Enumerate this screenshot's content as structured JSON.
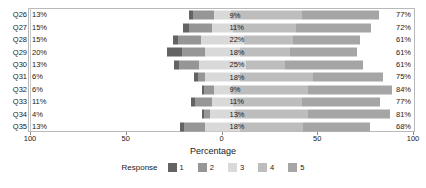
{
  "chart_data": {
    "type": "bar",
    "subtype": "diverging-stacked-likert",
    "title": "",
    "xlabel": "Percentage",
    "ylabel": "",
    "xlim": [
      -100,
      100
    ],
    "xticks": [
      100,
      50,
      0,
      50,
      100
    ],
    "grid": false,
    "legend": {
      "title": "Response",
      "position": "bottom",
      "entries": [
        {
          "label": "1",
          "color": "#636363"
        },
        {
          "label": "2",
          "color": "#969696"
        },
        {
          "label": "3",
          "color": "#d9d9d9"
        },
        {
          "label": "4",
          "color": "#bdbdbd"
        },
        {
          "label": "5",
          "color": "#a5a5a5"
        }
      ]
    },
    "categories": [
      "Q26",
      "Q27",
      "Q28",
      "Q29",
      "Q30",
      "Q31",
      "Q32",
      "Q33",
      "Q34",
      "Q35"
    ],
    "left_labels": [
      "13%",
      "15%",
      "15%",
      "20%",
      "13%",
      "6%",
      "6%",
      "11%",
      "4%",
      "13%"
    ],
    "mid_labels": [
      "9%",
      "11%",
      "22%",
      "18%",
      "25%",
      "18%",
      "9%",
      "11%",
      "13%",
      "18%"
    ],
    "right_labels": [
      "77%",
      "72%",
      "61%",
      "61%",
      "61%",
      "75%",
      "84%",
      "77%",
      "81%",
      "68%"
    ],
    "series": [
      {
        "name": "1",
        "color": "#636363",
        "values": [
          2,
          3,
          3,
          8,
          3,
          2,
          1,
          2,
          1,
          2
        ]
      },
      {
        "name": "2",
        "color": "#969696",
        "values": [
          11,
          12,
          12,
          12,
          10,
          4,
          5,
          9,
          3,
          11
        ]
      },
      {
        "name": "3",
        "color": "#d9d9d9",
        "values": [
          9,
          11,
          22,
          18,
          25,
          18,
          9,
          11,
          13,
          18
        ]
      },
      {
        "name": "4",
        "color": "#bdbdbd",
        "values": [
          37,
          33,
          26,
          26,
          20,
          38,
          40,
          36,
          38,
          33
        ]
      },
      {
        "name": "5",
        "color": "#a5a5a5",
        "values": [
          40,
          39,
          35,
          35,
          41,
          37,
          44,
          41,
          43,
          35
        ]
      }
    ],
    "rows": [
      {
        "category": "Q26",
        "left_label": "13%",
        "mid_label": "9%",
        "right_label": "77%",
        "segments": [
          {
            "series": "1",
            "value": 2,
            "start": -17.5
          },
          {
            "series": "2",
            "value": 11,
            "start": -15.5
          },
          {
            "series": "3",
            "value": 9,
            "start": -4.5
          },
          {
            "series": "4",
            "value": 37,
            "start": 4.5
          },
          {
            "series": "5",
            "value": 40,
            "start": 41.5
          }
        ]
      },
      {
        "category": "Q27",
        "left_label": "15%",
        "mid_label": "11%",
        "right_label": "72%",
        "segments": [
          {
            "series": "1",
            "value": 3,
            "start": -20.5
          },
          {
            "series": "2",
            "value": 12,
            "start": -17.5
          },
          {
            "series": "3",
            "value": 11,
            "start": -5.5
          },
          {
            "series": "4",
            "value": 33,
            "start": 5.5
          },
          {
            "series": "5",
            "value": 39,
            "start": 38.5
          }
        ]
      },
      {
        "category": "Q28",
        "left_label": "15%",
        "mid_label": "22%",
        "right_label": "61%",
        "segments": [
          {
            "series": "1",
            "value": 3,
            "start": -26
          },
          {
            "series": "2",
            "value": 12,
            "start": -23
          },
          {
            "series": "3",
            "value": 22,
            "start": -11
          },
          {
            "series": "4",
            "value": 26,
            "start": 11
          },
          {
            "series": "5",
            "value": 35,
            "start": 37
          }
        ]
      },
      {
        "category": "Q29",
        "left_label": "20%",
        "mid_label": "18%",
        "right_label": "61%",
        "segments": [
          {
            "series": "1",
            "value": 8,
            "start": -29
          },
          {
            "series": "2",
            "value": 12,
            "start": -21
          },
          {
            "series": "3",
            "value": 18,
            "start": -9
          },
          {
            "series": "4",
            "value": 26,
            "start": 9
          },
          {
            "series": "5",
            "value": 35,
            "start": 35
          }
        ]
      },
      {
        "category": "Q30",
        "left_label": "13%",
        "mid_label": "25%",
        "right_label": "61%",
        "segments": [
          {
            "series": "1",
            "value": 3,
            "start": -25.5
          },
          {
            "series": "2",
            "value": 10,
            "start": -22.5
          },
          {
            "series": "3",
            "value": 25,
            "start": -12.5
          },
          {
            "series": "4",
            "value": 20,
            "start": 12.5
          },
          {
            "series": "5",
            "value": 41,
            "start": 32.5
          }
        ]
      },
      {
        "category": "Q31",
        "left_label": "6%",
        "mid_label": "18%",
        "right_label": "75%",
        "segments": [
          {
            "series": "1",
            "value": 2,
            "start": -15
          },
          {
            "series": "2",
            "value": 4,
            "start": -13
          },
          {
            "series": "3",
            "value": 18,
            "start": -9
          },
          {
            "series": "4",
            "value": 38,
            "start": 9
          },
          {
            "series": "5",
            "value": 37,
            "start": 47
          }
        ]
      },
      {
        "category": "Q32",
        "left_label": "6%",
        "mid_label": "9%",
        "right_label": "84%",
        "segments": [
          {
            "series": "1",
            "value": 1,
            "start": -10.5
          },
          {
            "series": "2",
            "value": 5,
            "start": -9.5
          },
          {
            "series": "3",
            "value": 9,
            "start": -4.5
          },
          {
            "series": "4",
            "value": 40,
            "start": 4.5
          },
          {
            "series": "5",
            "value": 44,
            "start": 44.5
          }
        ]
      },
      {
        "category": "Q33",
        "left_label": "11%",
        "mid_label": "11%",
        "right_label": "77%",
        "segments": [
          {
            "series": "1",
            "value": 2,
            "start": -16.5
          },
          {
            "series": "2",
            "value": 9,
            "start": -14.5
          },
          {
            "series": "3",
            "value": 11,
            "start": -5.5
          },
          {
            "series": "4",
            "value": 36,
            "start": 5.5
          },
          {
            "series": "5",
            "value": 41,
            "start": 41.5
          }
        ]
      },
      {
        "category": "Q34",
        "left_label": "4%",
        "mid_label": "13%",
        "right_label": "81%",
        "segments": [
          {
            "series": "1",
            "value": 1,
            "start": -10.5
          },
          {
            "series": "2",
            "value": 3,
            "start": -9.5
          },
          {
            "series": "3",
            "value": 13,
            "start": -6.5
          },
          {
            "series": "4",
            "value": 38,
            "start": 6.5
          },
          {
            "series": "5",
            "value": 43,
            "start": 44.5
          }
        ]
      },
      {
        "category": "Q35",
        "left_label": "13%",
        "mid_label": "18%",
        "right_label": "68%",
        "segments": [
          {
            "series": "1",
            "value": 2,
            "start": -22
          },
          {
            "series": "2",
            "value": 11,
            "start": -20
          },
          {
            "series": "3",
            "value": 18,
            "start": -9
          },
          {
            "series": "4",
            "value": 33,
            "start": 9
          },
          {
            "series": "5",
            "value": 35,
            "start": 42
          }
        ]
      }
    ]
  }
}
